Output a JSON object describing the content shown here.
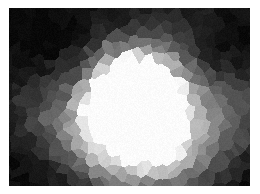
{
  "figure": {
    "kind": "grayscale-cellular-noise-field",
    "canvas_width": 260,
    "canvas_height": 194,
    "background_color": "#ffffff",
    "border": {
      "left": 9,
      "top": 8,
      "right": 10,
      "bottom": 8,
      "color": "#ffffff"
    },
    "plot": {
      "x": 9,
      "y": 8,
      "width": 241,
      "height": 178
    },
    "title": "",
    "caption": "",
    "axis_labels_visible": false,
    "legend_visible": false,
    "tick_labels_visible": false
  },
  "chart_data": {
    "type": "heatmap",
    "title": "",
    "subtitle": "",
    "xlabel": "",
    "ylabel": "",
    "legend": [],
    "annotations": [],
    "grid": false,
    "colormap": "grayscale",
    "colormap_stops": [
      {
        "t": 0.0,
        "hex": "#080808"
      },
      {
        "t": 0.15,
        "hex": "#1e1e1e"
      },
      {
        "t": 0.3,
        "hex": "#3a3a3a"
      },
      {
        "t": 0.45,
        "hex": "#585858"
      },
      {
        "t": 0.6,
        "hex": "#7d7d7d"
      },
      {
        "t": 0.75,
        "hex": "#a6a6a6"
      },
      {
        "t": 0.88,
        "hex": "#cfcfcf"
      },
      {
        "t": 1.0,
        "hex": "#fbfbfb"
      }
    ],
    "value_range": [
      8,
      251
    ],
    "xlim": [
      0,
      241
    ],
    "ylim": [
      0,
      178
    ],
    "cell_structure": {
      "style": "voronoi",
      "approx_cell_size_px": 10,
      "jitter": 0.55,
      "quantized": true
    },
    "field_model": {
      "description": "Smooth scalar field built from summed gaussian blobs, quantized onto voronoi cells, then rendered as grayscale.",
      "base_level": 22,
      "blobs": [
        {
          "cx": 128,
          "cy": 88,
          "rx": 34,
          "ry": 40,
          "amp": 236,
          "rot": -25
        },
        {
          "cx": 118,
          "cy": 104,
          "rx": 46,
          "ry": 52,
          "amp": 150,
          "rot": -20
        },
        {
          "cx": 140,
          "cy": 78,
          "rx": 58,
          "ry": 60,
          "amp": 110,
          "rot": -15
        },
        {
          "cx": 120,
          "cy": 100,
          "rx": 92,
          "ry": 86,
          "amp": 86,
          "rot": 0
        },
        {
          "cx": 112,
          "cy": 132,
          "rx": 70,
          "ry": 52,
          "amp": 72,
          "rot": 10
        },
        {
          "cx": 196,
          "cy": 120,
          "rx": 56,
          "ry": 58,
          "amp": 70,
          "rot": 0
        },
        {
          "cx": 60,
          "cy": 120,
          "rx": 40,
          "ry": 46,
          "amp": 50,
          "rot": 0
        },
        {
          "cx": 150,
          "cy": 160,
          "rx": 78,
          "ry": 42,
          "amp": 58,
          "rot": 0
        },
        {
          "cx": 236,
          "cy": 86,
          "rx": 34,
          "ry": 54,
          "amp": 40,
          "rot": 0
        },
        {
          "cx": 178,
          "cy": 18,
          "rx": 52,
          "ry": 30,
          "amp": 34,
          "rot": 0
        },
        {
          "cx": 18,
          "cy": 96,
          "rx": 30,
          "ry": 58,
          "amp": 22,
          "rot": 0
        }
      ],
      "dark_blobs": [
        {
          "cx": 48,
          "cy": 36,
          "rx": 70,
          "ry": 48,
          "amp": 40,
          "rot": 0
        },
        {
          "cx": 214,
          "cy": 44,
          "rx": 48,
          "ry": 40,
          "amp": 44,
          "rot": 0
        },
        {
          "cx": 34,
          "cy": 160,
          "rx": 52,
          "ry": 38,
          "amp": 34,
          "rot": 0
        },
        {
          "cx": 232,
          "cy": 168,
          "rx": 40,
          "ry": 34,
          "amp": 40,
          "rot": 0
        },
        {
          "cx": 150,
          "cy": 14,
          "rx": 56,
          "ry": 24,
          "amp": 30,
          "rot": 0
        }
      ]
    },
    "sampled_luminance_grid": {
      "note": "Mean 8-bit grey sampled on a coarse grid over the plot area; rows top to bottom, columns left to right.",
      "cols_x": [
        12,
        36,
        60,
        84,
        108,
        132,
        156,
        180,
        204,
        228
      ],
      "rows_y": [
        10,
        30,
        50,
        70,
        90,
        110,
        130,
        150,
        170
      ],
      "values": [
        [
          20,
          18,
          16,
          22,
          28,
          34,
          40,
          52,
          44,
          30
        ],
        [
          18,
          16,
          18,
          26,
          38,
          52,
          58,
          46,
          34,
          26
        ],
        [
          22,
          24,
          30,
          44,
          72,
          104,
          96,
          62,
          40,
          34
        ],
        [
          28,
          34,
          48,
          78,
          130,
          182,
          150,
          92,
          58,
          46
        ],
        [
          32,
          42,
          66,
          108,
          186,
          240,
          196,
          120,
          76,
          58
        ],
        [
          34,
          46,
          72,
          120,
          196,
          246,
          188,
          128,
          92,
          70
        ],
        [
          30,
          40,
          62,
          104,
          168,
          206,
          164,
          126,
          104,
          82
        ],
        [
          26,
          32,
          48,
          82,
          122,
          148,
          140,
          118,
          96,
          64
        ],
        [
          22,
          26,
          36,
          58,
          86,
          104,
          102,
          88,
          62,
          38
        ]
      ]
    },
    "features": [
      {
        "name": "bright-core",
        "cx": 132,
        "cy": 92,
        "peak_value": 251
      },
      {
        "name": "dark-top-left-corner",
        "cx": 20,
        "cy": 18,
        "value": 16
      },
      {
        "name": "dark-top-right-corner",
        "cx": 222,
        "cy": 34,
        "value": 24
      },
      {
        "name": "dark-bottom-left-corner",
        "cx": 22,
        "cy": 166,
        "value": 20
      },
      {
        "name": "dark-bottom-right-corner",
        "cx": 230,
        "cy": 170,
        "value": 34
      },
      {
        "name": "mid-grey-bottom-band",
        "cx": 130,
        "cy": 160,
        "value": 100
      },
      {
        "name": "mid-grey-right-band",
        "cx": 208,
        "cy": 118,
        "value": 92
      }
    ]
  }
}
